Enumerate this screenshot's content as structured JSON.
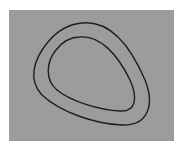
{
  "figure": {
    "background_color": "#9c9c9c",
    "stroke_color": "#1e1e1e",
    "curves": [
      {
        "name": "outer-contour"
      },
      {
        "name": "inner-contour"
      }
    ]
  }
}
